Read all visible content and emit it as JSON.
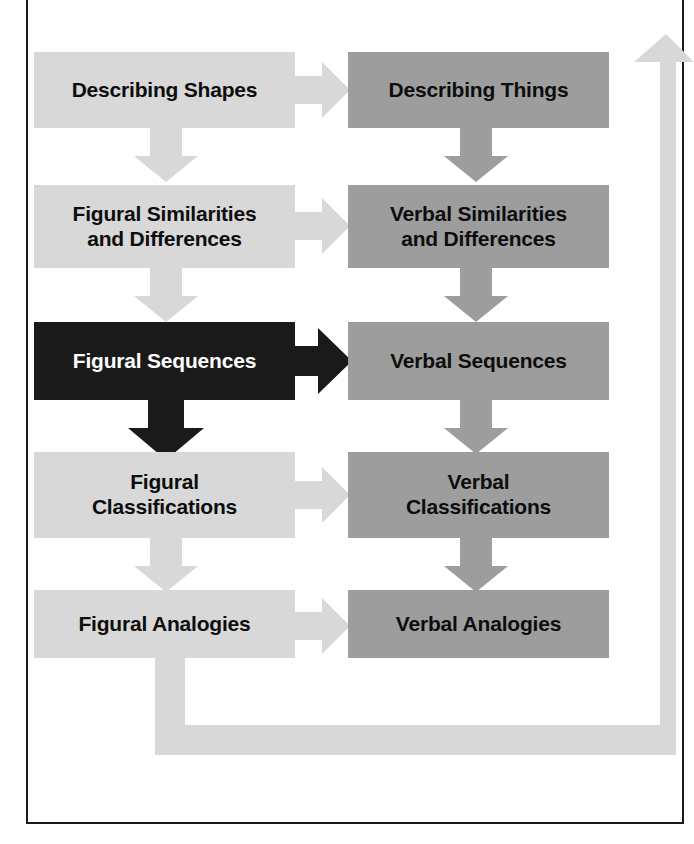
{
  "diagram": {
    "type": "flowchart",
    "columns": [
      {
        "id": "figural",
        "name": "Figural",
        "fill": "#d8d8d8",
        "text_color": "#0d0d0d"
      },
      {
        "id": "verbal",
        "name": "Verbal",
        "fill": "#9d9d9d",
        "text_color": "#0d0d0d"
      }
    ],
    "colors": {
      "figural_box": "#d8d8d8",
      "verbal_box": "#9d9d9d",
      "highlight_box": "#1a1a1a",
      "highlight_text": "#ffffff",
      "arrow_light": "#d8d8d8",
      "arrow_highlight": "#1a1a1a",
      "frame_border": "#1a1a1a",
      "background": "#ffffff"
    },
    "rows": [
      {
        "index": 1,
        "figural": "Describing Shapes",
        "verbal": "Describing Things"
      },
      {
        "index": 2,
        "figural": "Figural Similarities\nand Differences",
        "verbal": "Verbal Similarities\nand Differences"
      },
      {
        "index": 3,
        "figural": "Figural Sequences",
        "verbal": "Verbal Sequences",
        "figural_highlighted": true
      },
      {
        "index": 4,
        "figural": "Figural\nClassifications",
        "verbal": "Verbal\nClassifications"
      },
      {
        "index": 5,
        "figural": "Figural Analogies",
        "verbal": "Verbal Analogies"
      }
    ],
    "nodes": {
      "figural_1": {
        "label_line_1": "Describing Shapes"
      },
      "verbal_1": {
        "label_line_1": "Describing Things"
      },
      "figural_2": {
        "label_line_1": "Figural Similarities",
        "label_line_2": "and Differences"
      },
      "verbal_2": {
        "label_line_1": "Verbal Similarities",
        "label_line_2": "and Differences"
      },
      "figural_3": {
        "label_line_1": "Figural Sequences"
      },
      "verbal_3": {
        "label_line_1": "Verbal Sequences"
      },
      "figural_4": {
        "label_line_1": "Figural",
        "label_line_2": "Classifications"
      },
      "verbal_4": {
        "label_line_1": "Verbal",
        "label_line_2": "Classifications"
      },
      "figural_5": {
        "label_line_1": "Figural Analogies"
      },
      "verbal_5": {
        "label_line_1": "Verbal Analogies"
      }
    },
    "connectors": [
      {
        "name": "figural-1-to-figural-2",
        "direction": "down",
        "style": "light"
      },
      {
        "name": "figural-2-to-figural-3",
        "direction": "down",
        "style": "light"
      },
      {
        "name": "figural-3-to-figural-4",
        "direction": "down",
        "style": "highlight"
      },
      {
        "name": "figural-4-to-figural-5",
        "direction": "down",
        "style": "light"
      },
      {
        "name": "verbal-1-to-verbal-2",
        "direction": "down",
        "style": "light"
      },
      {
        "name": "verbal-2-to-verbal-3",
        "direction": "down",
        "style": "light"
      },
      {
        "name": "verbal-3-to-verbal-4",
        "direction": "down",
        "style": "light"
      },
      {
        "name": "verbal-4-to-verbal-5",
        "direction": "down",
        "style": "light"
      },
      {
        "name": "figural-1-to-verbal-1",
        "direction": "right",
        "style": "light"
      },
      {
        "name": "figural-2-to-verbal-2",
        "direction": "right",
        "style": "light"
      },
      {
        "name": "figural-3-to-verbal-3",
        "direction": "right",
        "style": "highlight"
      },
      {
        "name": "figural-4-to-verbal-4",
        "direction": "right",
        "style": "light"
      },
      {
        "name": "figural-5-to-verbal-5",
        "direction": "right",
        "style": "light"
      },
      {
        "name": "figural-5-feedback-to-verbal-1",
        "direction": "loop-up-left",
        "style": "light"
      }
    ]
  }
}
